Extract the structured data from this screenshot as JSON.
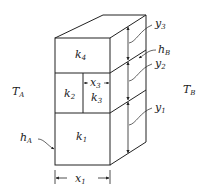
{
  "diagram": {
    "ambient_left": {
      "symbol": "T",
      "sub": "A"
    },
    "ambient_right": {
      "symbol": "T",
      "sub": "B"
    },
    "materials": [
      {
        "symbol": "k",
        "sub": "4"
      },
      {
        "symbol": "k",
        "sub": "2"
      },
      {
        "symbol": "k",
        "sub": "3"
      },
      {
        "symbol": "k",
        "sub": "1"
      }
    ],
    "dimensions": {
      "x1": {
        "symbol": "x",
        "sub": "1"
      },
      "x3": {
        "symbol": "x",
        "sub": "3"
      },
      "y1": {
        "symbol": "y",
        "sub": "1"
      },
      "y2": {
        "symbol": "y",
        "sub": "2"
      },
      "y3": {
        "symbol": "y",
        "sub": "3"
      }
    },
    "convection": {
      "hA": {
        "symbol": "h",
        "sub": "A"
      },
      "hB": {
        "symbol": "h",
        "sub": "B"
      }
    },
    "colors": {
      "line": "#222222",
      "background": "#ffffff"
    }
  }
}
